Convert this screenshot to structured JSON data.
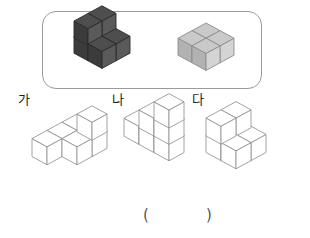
{
  "page": {
    "kind": "math-worksheet-question",
    "answer_blank": {
      "open": "(",
      "close": ")"
    }
  },
  "prompt_box": {
    "border_color": "#9a9a9a",
    "figures": [
      {
        "name": "dark-solid",
        "fill_top": "#4e4e4e",
        "fill_left": "#3b3b3b",
        "fill_right": "#5a5a5a",
        "stroke": "#2b2b2b",
        "cube_count": 6,
        "description": "L-shaped stair solid, dark gray"
      },
      {
        "name": "light-solid",
        "fill_top": "#c9c9c9",
        "fill_left": "#b2b2b2",
        "fill_right": "#d4d4d4",
        "stroke": "#8d8d8d",
        "cube_count": 4,
        "description": "2 by 2 by 1 flat block, light gray"
      }
    ]
  },
  "choices": [
    {
      "label": "가",
      "name": "choice-ga",
      "cube_count": 6,
      "stroke": "#8c8c8c",
      "fill_top": "#ffffff",
      "fill_left": "#ffffff",
      "fill_right": "#ffffff"
    },
    {
      "label": "나",
      "name": "choice-na",
      "cube_count": 6,
      "stroke": "#8c8c8c",
      "fill_top": "#ffffff",
      "fill_left": "#ffffff",
      "fill_right": "#ffffff"
    },
    {
      "label": "다",
      "name": "choice-da",
      "cube_count": 6,
      "stroke": "#8c8c8c",
      "fill_top": "#ffffff",
      "fill_left": "#ffffff",
      "fill_right": "#ffffff"
    }
  ]
}
